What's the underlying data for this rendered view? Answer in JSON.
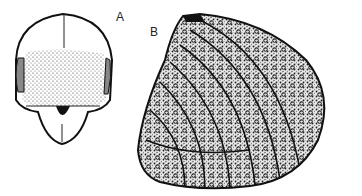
{
  "figure": {
    "panels": [
      {
        "label": "A",
        "subject": "head, frontal view (stippled)"
      },
      {
        "label": "B",
        "subject": "punctate sculptured plate with striae"
      }
    ]
  },
  "colors": {
    "ink": "#1a1a1a",
    "paper": "#ffffff"
  }
}
